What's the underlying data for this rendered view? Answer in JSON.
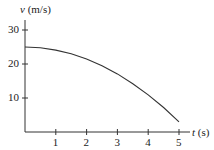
{
  "chart_data": {
    "type": "line",
    "title": "",
    "xlabel": "t (s)",
    "ylabel": "v (m/s)",
    "xlabel_var": "t",
    "xlabel_unit": "(s)",
    "ylabel_var": "v",
    "ylabel_unit": "(m/s)",
    "xlim": [
      0,
      5.5
    ],
    "ylim": [
      0,
      32
    ],
    "x_ticks": [
      "1",
      "2",
      "3",
      "4",
      "5"
    ],
    "y_ticks": [
      "10",
      "20",
      "30"
    ],
    "grid": false,
    "legend": null,
    "series": [
      {
        "name": "v(t)",
        "x": [
          0,
          0.5,
          1,
          1.5,
          2,
          2.5,
          3,
          3.5,
          4,
          4.5,
          5
        ],
        "values": [
          25,
          24.8,
          24.1,
          23.0,
          21.5,
          19.5,
          17.1,
          14.2,
          10.9,
          7.2,
          3.0
        ]
      }
    ]
  }
}
